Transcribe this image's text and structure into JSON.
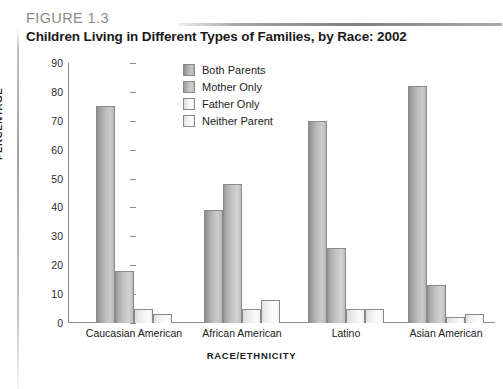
{
  "figure": {
    "label": "FIGURE 1.3",
    "title": "Children Living in Different Types of Families, by Race: 2002"
  },
  "colors": {
    "axis": "#8d8d8d",
    "rule": "#9a9a9a",
    "label_gray": "#8c8c8c",
    "text": "#1a1a1a",
    "series_both_parents": "#bcbcbc",
    "series_mother_only": "#c4c4c4",
    "series_father_only": "#f4f4f4",
    "series_neither_parent": "#f8f8f8"
  },
  "chart_data": {
    "type": "bar",
    "title": "Children Living in Different Types of Families, by Race: 2002",
    "xlabel": "RACE/ETHNICITY",
    "ylabel": "PERCENTAGE",
    "ylim": [
      0,
      90
    ],
    "yticks": [
      0,
      10,
      20,
      30,
      40,
      50,
      60,
      70,
      80,
      90
    ],
    "grid": false,
    "legend_position": "top-center",
    "categories": [
      "Caucasian American",
      "African American",
      "Latino",
      "Asian American"
    ],
    "series": [
      {
        "name": "Both Parents",
        "values": [
          75,
          39,
          70,
          82
        ]
      },
      {
        "name": "Mother Only",
        "values": [
          18,
          48,
          26,
          13
        ]
      },
      {
        "name": "Father Only",
        "values": [
          5,
          5,
          5,
          2
        ]
      },
      {
        "name": "Neither Parent",
        "values": [
          3,
          8,
          5,
          3
        ]
      }
    ]
  }
}
